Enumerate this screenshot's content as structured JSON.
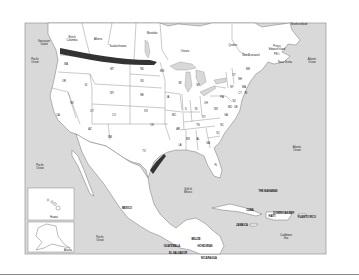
{
  "map": {
    "title": "North America and Caribbean outline map",
    "colors": {
      "water": "#d9d9d9",
      "land": "#ffffff",
      "border": "#555555",
      "highlight": "#333333",
      "frame": "#888888"
    },
    "oceans": [
      {
        "name": "pacific-upper",
        "line1": "Pacific",
        "line2": "Ocean"
      },
      {
        "name": "pacific-middle",
        "line1": "Pacific",
        "line2": "Ocean"
      },
      {
        "name": "pacific-lower",
        "line1": "Pacific",
        "line2": "Ocean"
      },
      {
        "name": "atlantic-upper",
        "line1": "Atlantic",
        "line2": "Ocean"
      },
      {
        "name": "atlantic-middle",
        "line1": "Atlantic",
        "line2": "Ocean"
      },
      {
        "name": "gulf-of-mexico",
        "line1": "Gulf of",
        "line2": "Mexico"
      },
      {
        "name": "caribbean-sea",
        "line1": "Caribbean",
        "line2": "Sea"
      }
    ],
    "provinces": [
      {
        "name": "british-columbia",
        "line1": "British",
        "line2": "Columbia"
      },
      {
        "name": "alberta",
        "line1": "Alberta",
        "line2": ""
      },
      {
        "name": "saskatchewan",
        "line1": "Saskatchewan",
        "line2": ""
      },
      {
        "name": "manitoba",
        "line1": "Manitoba",
        "line2": ""
      },
      {
        "name": "ontario",
        "line1": "Ontario",
        "line2": ""
      },
      {
        "name": "quebec",
        "line1": "Quebec",
        "line2": ""
      },
      {
        "name": "newfoundland",
        "line1": "Newfoundland",
        "line2": ""
      },
      {
        "name": "vancouver-island",
        "line1": "Vancouver",
        "line2": "Island"
      },
      {
        "name": "new-brunswick",
        "line1": "New Brunswick",
        "line2": ""
      },
      {
        "name": "prince-edward-island",
        "line1": "Prince",
        "line2": "Edward Island"
      },
      {
        "name": "pei-abbrev",
        "line1": "P.E.I.",
        "line2": ""
      },
      {
        "name": "nova-scotia",
        "line1": "Nova Scotia",
        "line2": ""
      }
    ],
    "states": [
      "WA",
      "OR",
      "CA",
      "ID",
      "NV",
      "MT",
      "WY",
      "UT",
      "AZ",
      "CO",
      "NM",
      "ND",
      "SD",
      "NE",
      "KS",
      "OK",
      "TX",
      "MN",
      "IA",
      "MO",
      "AR",
      "LA",
      "WI",
      "IL",
      "MI",
      "IN",
      "OH",
      "KY",
      "TN",
      "MS",
      "AL",
      "GA",
      "FL",
      "SC",
      "NC",
      "VA",
      "WV",
      "PA",
      "NY",
      "VT",
      "NH",
      "ME",
      "MA",
      "CT",
      "RI",
      "NJ",
      "DE",
      "MD"
    ],
    "countries": [
      {
        "name": "mexico",
        "label": "MEXICO"
      },
      {
        "name": "cuba",
        "label": "CUBA"
      },
      {
        "name": "the-bahamas",
        "label": "THE BAHAMAS"
      },
      {
        "name": "jamaica",
        "label": "JAMAICA"
      },
      {
        "name": "haiti",
        "label": "HAITI"
      },
      {
        "name": "dominican-republic",
        "label": "DOMINICAN REP."
      },
      {
        "name": "puerto-rico",
        "label": "PUERTO RICO"
      },
      {
        "name": "belize",
        "label": "BELIZE"
      },
      {
        "name": "guatemala",
        "label": "GUATEMALA"
      },
      {
        "name": "honduras",
        "label": "HONDURAS"
      },
      {
        "name": "el-salvador",
        "label": "EL SALVADOR"
      },
      {
        "name": "nicaragua",
        "label": "NICARAGUA"
      }
    ],
    "insets": [
      {
        "name": "hawaii",
        "label": "Hawaii"
      },
      {
        "name": "alaska",
        "label": "Alaska"
      }
    ],
    "highlights": [
      {
        "name": "us-canada-northern-border-band"
      },
      {
        "name": "texas-gulf-coast-band"
      }
    ]
  }
}
